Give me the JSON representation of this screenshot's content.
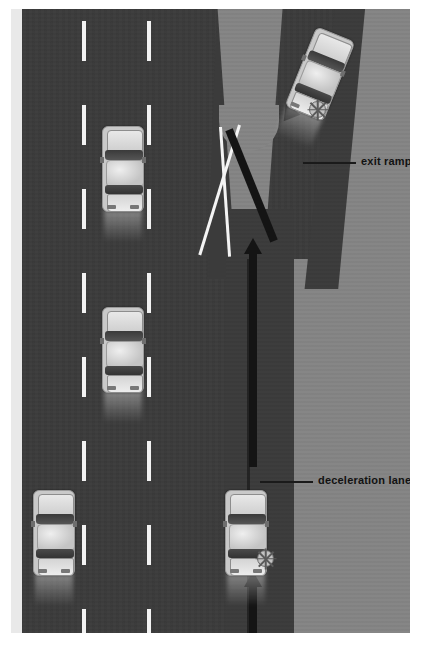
{
  "diagram": {
    "colors": {
      "asphalt": "#3b3b3b",
      "shoulder": "#848484",
      "lane_marking": "#f2f2f2",
      "gore_marking": "#f4f4f4",
      "arrow": "#141414",
      "label_text": "#121212",
      "page_background": "#ffffff",
      "left_shoulder": "#e9e9e9"
    },
    "labels": [
      {
        "id": "exit-ramp",
        "text": "exit ramp"
      },
      {
        "id": "deceleration-lane",
        "text": "deceleration lane"
      }
    ],
    "elements": {
      "exit_ramp_label": "exit ramp",
      "deceleration_lane_label": "deceleration lane"
    },
    "vehicles": [
      {
        "id": "car-exiting-ramp",
        "lane": "exit ramp",
        "heading_deg": 22,
        "signal": "right-turn-signal-on"
      },
      {
        "id": "car-center-upper",
        "lane": "center lane",
        "heading_deg": 0,
        "signal": "none"
      },
      {
        "id": "car-center-lower",
        "lane": "center lane",
        "heading_deg": 0,
        "signal": "none"
      },
      {
        "id": "car-left-bottom",
        "lane": "left lane",
        "heading_deg": 0,
        "signal": "none"
      },
      {
        "id": "car-deceleration-lane",
        "lane": "deceleration lane",
        "heading_deg": 0,
        "signal": "right-turn-signal-on"
      }
    ],
    "paths": [
      {
        "id": "path-arrow-lower",
        "description": "vehicle path entering deceleration lane"
      },
      {
        "id": "path-arrow-middle",
        "description": "vehicle path along deceleration lane"
      },
      {
        "id": "path-arrow-upper",
        "description": "vehicle path onto exit ramp"
      }
    ]
  }
}
